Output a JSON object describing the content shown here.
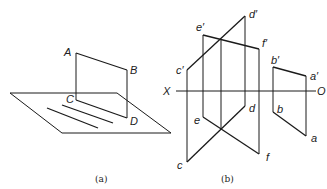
{
  "figure_a": {
    "caption": "(a)",
    "labels": {
      "A": "A",
      "B": "B",
      "C": "C",
      "D": "D"
    }
  },
  "figure_b": {
    "caption": "(b)",
    "axis": {
      "left": "X",
      "right": "O"
    },
    "labels": {
      "d_prime": "d′",
      "e_prime": "e′",
      "f_prime": "f′",
      "c_prime": "c′",
      "b_prime": "b′",
      "a_prime": "a′",
      "d": "d",
      "e": "e",
      "b": "b",
      "c": "c",
      "f": "f",
      "a": "a"
    }
  },
  "colors": {
    "line": "#1a1a1a",
    "background": "#ffffff"
  }
}
